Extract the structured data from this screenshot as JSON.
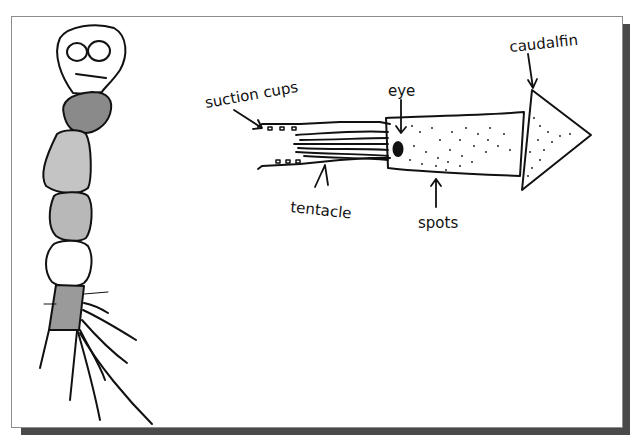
{
  "figure": {
    "labels": {
      "suction_cups": "suction cups",
      "eye": "eye",
      "caudal_fin": "caudalfin",
      "tentacle": "tentacle",
      "spots": "spots"
    },
    "colors": {
      "ink": "#111111",
      "paper": "#ffffff",
      "frame_border": "#8c8c8c",
      "shadow": "#4a4a4a",
      "shade_dark": "#8a8a8a",
      "shade_light": "#c4c4c4"
    }
  }
}
